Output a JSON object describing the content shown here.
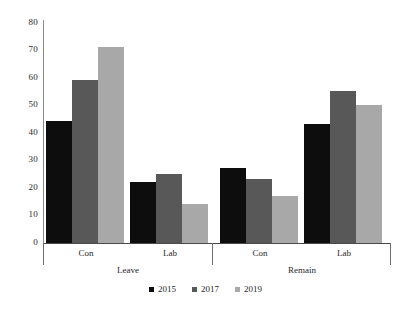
{
  "chart_data": {
    "type": "bar",
    "title": "",
    "subtitle": "",
    "xlabel": "",
    "ylabel": "",
    "ylim": [
      0,
      80
    ],
    "yticks": [
      0,
      10,
      20,
      30,
      40,
      50,
      60,
      70,
      80
    ],
    "grid": false,
    "legend_position": "bottom",
    "group_labels": [
      "Leave",
      "Remain"
    ],
    "categories": [
      "Con",
      "Lab",
      "Con",
      "Lab"
    ],
    "category_groups": [
      {
        "super": "Leave",
        "categories": [
          "Con",
          "Lab"
        ]
      },
      {
        "super": "Remain",
        "categories": [
          "Con",
          "Lab"
        ]
      }
    ],
    "series": [
      {
        "name": "2015",
        "color": "#0d0d0d",
        "values": [
          44,
          22,
          27,
          43
        ]
      },
      {
        "name": "2017",
        "color": "#585858",
        "values": [
          59,
          25,
          23,
          55
        ]
      },
      {
        "name": "2019",
        "color": "#a8a8a8",
        "values": [
          71,
          14,
          17,
          50
        ]
      }
    ]
  },
  "axis": {
    "y_tick_labels": [
      "80",
      "70",
      "60",
      "50",
      "40",
      "30",
      "20",
      "10",
      "0"
    ],
    "category_labels": [
      "Con",
      "Lab",
      "Con",
      "Lab"
    ],
    "super_labels": [
      "Leave",
      "Remain"
    ]
  },
  "legend": {
    "items": [
      {
        "label": "2015",
        "color": "#0d0d0d"
      },
      {
        "label": "2017",
        "color": "#585858"
      },
      {
        "label": "2019",
        "color": "#a8a8a8"
      }
    ]
  },
  "colors": {
    "series_2015": "#0d0d0d",
    "series_2017": "#585858",
    "series_2019": "#a8a8a8",
    "axis": "#4a4a4a",
    "background": "#ffffff"
  }
}
